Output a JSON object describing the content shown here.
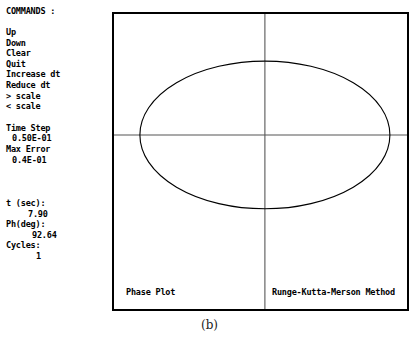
{
  "commands": {
    "title": "COMMANDS :",
    "items": [
      {
        "label": "Up"
      },
      {
        "label": "Down"
      },
      {
        "label": "Clear"
      },
      {
        "label": "Quit"
      },
      {
        "label": "Increase dt"
      },
      {
        "label": "Reduce dt"
      },
      {
        "label": "> scale"
      },
      {
        "label": "< scale"
      }
    ]
  },
  "parameters": {
    "time_step_label": "Time Step",
    "time_step_value": "0.50E-01",
    "max_error_label": "Max Error",
    "max_error_value": "0.4E-01"
  },
  "status": {
    "time_label": "t (sec):",
    "time_value": "7.90",
    "phase_label": "Ph(deg):",
    "phase_value": "92.64",
    "cycles_label": "Cycles:",
    "cycles_value": "1"
  },
  "plot": {
    "title": "Phase Plot",
    "method": "Runge-Kutta-Merson Method"
  },
  "caption": {
    "text": "(b)"
  },
  "chart_data": {
    "type": "line",
    "title": "Phase Plot",
    "subtitle": "Runge-Kutta-Merson Method",
    "xlabel": "",
    "ylabel": "",
    "grid": false,
    "legend": null,
    "axes": {
      "style": "crosshair",
      "origin_x_frac": 0.515,
      "origin_y_frac": 0.41,
      "x_axis_visible": true,
      "y_axis_visible": true
    },
    "xlim": [
      -1.0,
      1.0
    ],
    "ylim": [
      -1.0,
      1.0
    ],
    "series": [
      {
        "name": "trajectory",
        "shape": "ellipse",
        "center": [
          0.0,
          0.0
        ],
        "semi_axis_x": 0.855,
        "semi_axis_y": 0.55,
        "closed": true,
        "color": "#000000"
      }
    ]
  }
}
